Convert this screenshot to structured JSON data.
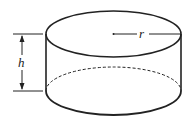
{
  "diagram": {
    "type": "cylinder",
    "labels": {
      "height": "h",
      "radius": "r"
    },
    "colors": {
      "stroke": "#222222",
      "background": "#ffffff"
    }
  }
}
